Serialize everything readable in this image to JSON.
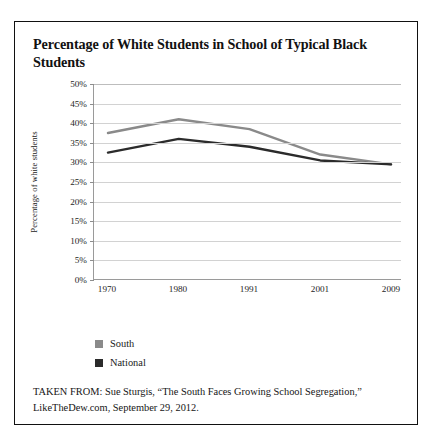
{
  "page": {
    "title": "Percentage of White Students in School of Typical Black Students",
    "source_note": "TAKEN FROM: Sue Sturgis, “The South Faces Growing School Segregation,” LikeTheDew.com, September 29, 2012."
  },
  "colors": {
    "south": "#8a8a8a",
    "national": "#2b2b2b",
    "gridline": "#d2d2d2",
    "axis": "#9a9a9a",
    "border": "#111111",
    "background": "#ffffff"
  },
  "chart_data": {
    "type": "line",
    "title": "Percentage of White Students in School of Typical Black Students",
    "xlabel": "",
    "ylabel": "Percentage of white students",
    "categories": [
      "1970",
      "1980",
      "1991",
      "2001",
      "2009"
    ],
    "ylim": [
      0,
      50
    ],
    "ytick_labels": [
      "50%",
      "45%",
      "40%",
      "35%",
      "30%",
      "25%",
      "20%",
      "15%",
      "10%",
      "5%",
      "0%"
    ],
    "ytick_values": [
      50,
      45,
      40,
      35,
      30,
      25,
      20,
      15,
      10,
      5,
      0
    ],
    "grid": true,
    "legend_position": "below-left",
    "series": [
      {
        "name": "South",
        "color": "#8a8a8a",
        "values": [
          37.5,
          41.0,
          38.5,
          32.0,
          29.5
        ]
      },
      {
        "name": "National",
        "color": "#2b2b2b",
        "values": [
          32.5,
          36.0,
          34.0,
          30.5,
          29.5
        ]
      }
    ]
  }
}
